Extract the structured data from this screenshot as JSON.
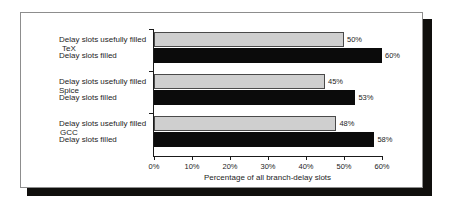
{
  "chart_data": {
    "type": "bar",
    "orientation": "horizontal",
    "title": "",
    "xlabel": "Percentage of all branch-delay slots",
    "ylabel": "",
    "xlim": [
      0,
      60
    ],
    "xunit": "%",
    "grid": false,
    "legend": "inline-row-labels",
    "categories": [
      "TeX",
      "Spice",
      "GCC"
    ],
    "xticks": [
      {
        "value": 0,
        "label": "0%"
      },
      {
        "value": 10,
        "label": "10%"
      },
      {
        "value": 20,
        "label": "20%"
      },
      {
        "value": 30,
        "label": "30%"
      },
      {
        "value": 40,
        "label": "40%"
      },
      {
        "value": 50,
        "label": "50%"
      },
      {
        "value": 60,
        "label": "60%"
      }
    ],
    "series": [
      {
        "name": "Delay slots usefully filled",
        "color": "#cfcfcf",
        "values": [
          50,
          45,
          48
        ],
        "value_labels": [
          "50%",
          "45%",
          "48%"
        ]
      },
      {
        "name": "Delay slots filled",
        "color": "#0b0b0b",
        "values": [
          60,
          53,
          58
        ],
        "value_labels": [
          "60%",
          "53%",
          "58%"
        ]
      }
    ],
    "rows": [
      {
        "category": "TeX",
        "bars": [
          {
            "series": "Delay slots usefully filled",
            "value": 50,
            "label": "50%"
          },
          {
            "series": "Delay slots filled",
            "value": 60,
            "label": "60%"
          }
        ]
      },
      {
        "category": "Spice",
        "bars": [
          {
            "series": "Delay slots usefully filled",
            "value": 45,
            "label": "45%"
          },
          {
            "series": "Delay slots filled",
            "value": 53,
            "label": "53%"
          }
        ]
      },
      {
        "category": "GCC",
        "bars": [
          {
            "series": "Delay slots usefully filled",
            "value": 48,
            "label": "48%"
          },
          {
            "series": "Delay slots filled",
            "value": 58,
            "label": "58%"
          }
        ]
      }
    ]
  }
}
